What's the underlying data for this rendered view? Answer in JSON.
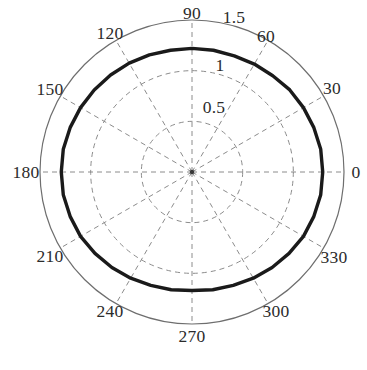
{
  "figure": {
    "type": "polar-plot",
    "background_color": "#ffffff",
    "caption": "天线方向图仿真结果"
  },
  "chart_data": {
    "type": "line",
    "coordinate_system": "polar",
    "title": "",
    "xlabel": "",
    "ylabel": "",
    "angle_unit": "degrees",
    "angle_direction": "counterclockwise",
    "zero_angle_position": "east",
    "grid": true,
    "grid_color": "#8c8c8c",
    "grid_style": "dashed",
    "outer_circle_color": "#6e6e6e",
    "rlim": [
      0,
      1.5
    ],
    "r_ticks": [
      0.5,
      1,
      1.5
    ],
    "r_tick_labels": [
      "0.5",
      "1",
      "1.5"
    ],
    "r_tick_label_angle_deg": 78,
    "theta_ticks": [
      0,
      30,
      60,
      90,
      120,
      150,
      180,
      210,
      240,
      270,
      300,
      330
    ],
    "theta_tick_labels": [
      "0",
      "30",
      "60",
      "90",
      "120",
      "150",
      "180",
      "210",
      "240",
      "270",
      "300",
      "330"
    ],
    "series": [
      {
        "name": "pattern",
        "color": "#1a1a1a",
        "line_width": 3.4,
        "style": "solid",
        "closed": true,
        "theta": [
          0,
          10,
          20,
          30,
          40,
          50,
          60,
          70,
          80,
          90,
          100,
          110,
          120,
          130,
          140,
          150,
          160,
          170,
          180,
          190,
          200,
          210,
          220,
          230,
          240,
          250,
          260,
          270,
          280,
          290,
          300,
          310,
          320,
          330,
          340,
          350
        ],
        "r": [
          1.29,
          1.29,
          1.28,
          1.27,
          1.26,
          1.24,
          1.23,
          1.22,
          1.22,
          1.22,
          1.22,
          1.23,
          1.24,
          1.25,
          1.26,
          1.27,
          1.28,
          1.29,
          1.29,
          1.29,
          1.28,
          1.27,
          1.25,
          1.23,
          1.21,
          1.19,
          1.18,
          1.17,
          1.18,
          1.19,
          1.21,
          1.23,
          1.25,
          1.27,
          1.28,
          1.29
        ]
      }
    ]
  },
  "labels": {
    "angles": [
      {
        "text": "0",
        "x": 356,
        "y": 172
      },
      {
        "text": "30",
        "x": 332,
        "y": 88
      },
      {
        "text": "60",
        "x": 266,
        "y": 36
      },
      {
        "text": "90",
        "x": 192,
        "y": 13
      },
      {
        "text": "120",
        "x": 110,
        "y": 33
      },
      {
        "text": "150",
        "x": 50,
        "y": 89
      },
      {
        "text": "180",
        "x": 26,
        "y": 172
      },
      {
        "text": "210",
        "x": 50,
        "y": 256
      },
      {
        "text": "240",
        "x": 110,
        "y": 311
      },
      {
        "text": "270",
        "x": 192,
        "y": 336
      },
      {
        "text": "300",
        "x": 276,
        "y": 311
      },
      {
        "text": "330",
        "x": 334,
        "y": 257
      }
    ],
    "radials": [
      {
        "text": "0.5",
        "x": 214,
        "y": 107
      },
      {
        "text": "1",
        "x": 220,
        "y": 65
      },
      {
        "text": "1.5",
        "x": 234,
        "y": 17
      }
    ]
  }
}
